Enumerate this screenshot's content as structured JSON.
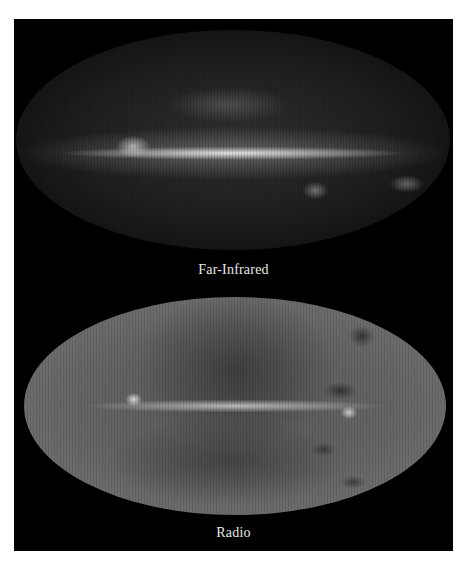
{
  "figure": {
    "panels": [
      {
        "id": "far-infrared",
        "caption": "Far-Infrared",
        "description": "All-sky map of the Milky Way in far-infrared light (elliptical projection), bright galactic plane band across the middle"
      },
      {
        "id": "radio",
        "caption": "Radio",
        "description": "All-sky map of the Milky Way in radio wavelengths (elliptical projection), gray sky with bright galactic plane and large loop structure"
      }
    ]
  },
  "colors": {
    "page_background": "#ffffff",
    "panel_background": "#000000",
    "caption_text": "#e8e8e8"
  }
}
